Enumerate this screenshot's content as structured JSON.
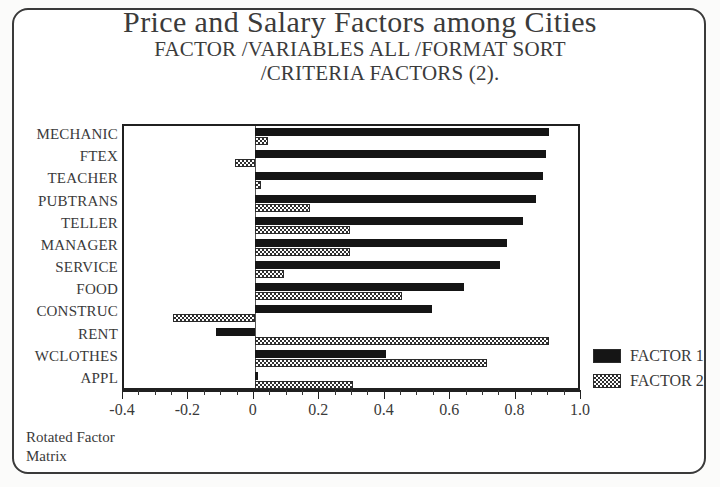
{
  "chart_data": {
    "type": "bar",
    "orientation": "horizontal",
    "title": "Price and Salary Factors among Cities",
    "subtitle_line_1": "FACTOR /VARIABLES ALL /FORMAT SORT",
    "subtitle_line_2": "/CRITERIA FACTORS (2).",
    "caption_line_1": "Rotated Factor",
    "caption_line_2": "Matrix",
    "xlabel": "",
    "ylabel": "",
    "xlim": [
      -0.4,
      1.0
    ],
    "xticks": [
      -0.4,
      -0.2,
      0,
      0.2,
      0.4,
      0.6,
      0.8,
      1.0
    ],
    "xtick_labels": [
      "-0.4",
      "-0.2",
      "0",
      "0.2",
      "0.4",
      "0.6",
      "0.8",
      "1.0"
    ],
    "minor_tick_step": 0.05,
    "grid": false,
    "legend_position": "right",
    "categories": [
      "MECHANIC",
      "FTEX",
      "TEACHER",
      "PUBTRANS",
      "TELLER",
      "MANAGER",
      "SERVICE",
      "FOOD",
      "CONSTRUC",
      "RENT",
      "WCLOTHES",
      "APPL"
    ],
    "series": [
      {
        "name": "FACTOR 1",
        "fill": "solid-black",
        "color": "#151515",
        "values": [
          0.9,
          0.89,
          0.88,
          0.86,
          0.82,
          0.77,
          0.75,
          0.64,
          0.54,
          -0.12,
          0.4,
          0.01
        ]
      },
      {
        "name": "FACTOR 2",
        "fill": "checkered",
        "color": "#303030",
        "values": [
          0.04,
          -0.06,
          0.02,
          0.17,
          0.29,
          0.29,
          0.09,
          0.45,
          -0.25,
          0.9,
          0.71,
          0.3
        ]
      }
    ]
  },
  "legend": {
    "items": [
      {
        "label": "FACTOR 1"
      },
      {
        "label": "FACTOR 2"
      }
    ]
  }
}
